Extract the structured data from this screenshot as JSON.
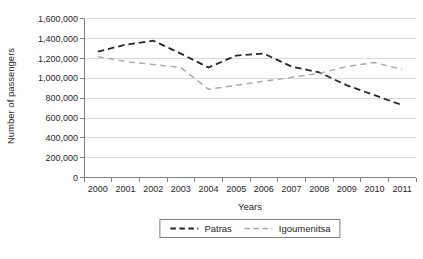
{
  "chart_data": {
    "type": "line",
    "title": "",
    "xlabel": "Years",
    "ylabel": "Number of passengers",
    "x": [
      "2000",
      "2001",
      "2002",
      "2003",
      "2004",
      "2005",
      "2006",
      "2007",
      "2008",
      "2009",
      "2010",
      "2011"
    ],
    "series": [
      {
        "name": "Patras",
        "color": "#262626",
        "dash": "6.5 4",
        "width": 1.8,
        "values": [
          1270000,
          1340000,
          1380000,
          1250000,
          1110000,
          1230000,
          1250000,
          1120000,
          1060000,
          930000,
          830000,
          730000
        ]
      },
      {
        "name": "Igoumenitsa",
        "color": "#a8a8a8",
        "dash": "6 4.5",
        "width": 1.4,
        "values": [
          1220000,
          1170000,
          1140000,
          1110000,
          890000,
          930000,
          970000,
          1010000,
          1050000,
          1120000,
          1160000,
          1090000
        ]
      }
    ],
    "ylim": [
      0,
      1600000
    ],
    "ytick_step": 200000,
    "ytick_labels": [
      "0",
      "200,000",
      "400,000",
      "600,000",
      "800,000",
      "1,000,000",
      "1,200,000",
      "1,400,000",
      "1,600,000"
    ],
    "grid": true,
    "legend_position": "bottom-center"
  },
  "colors": {
    "gridline": "#d9d9d9",
    "axis": "#7f7f7f",
    "text": "#262626",
    "legend_border": "#7f7f7f",
    "background": "#ffffff"
  }
}
